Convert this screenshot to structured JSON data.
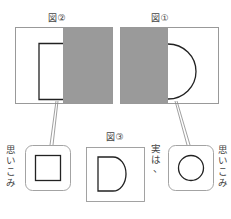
{
  "figures": {
    "fig2": {
      "label": "図②"
    },
    "fig1": {
      "label": "図①"
    },
    "fig3": {
      "label": "図③"
    }
  },
  "annotations": {
    "left_vertical": [
      "思",
      "い",
      "こ",
      "み"
    ],
    "middle_vertical": [
      "実",
      "は",
      "、"
    ],
    "right_vertical": [
      "思",
      "い",
      "こ",
      "み"
    ]
  },
  "colors": {
    "gray_fill": "#9a9a9a",
    "line": "#333333",
    "frame": "#888888"
  }
}
